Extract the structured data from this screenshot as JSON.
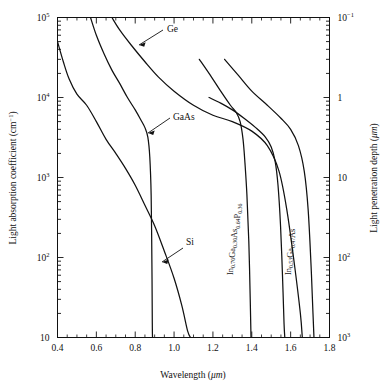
{
  "figure": {
    "background": "#ffffff",
    "line_color": "#111111"
  },
  "axes": {
    "x": {
      "title": "Wavelength (μm)",
      "title_main": "Wavelength (",
      "title_unit": "μm",
      "title_tail": ")",
      "min": 0.4,
      "max": 1.8,
      "ticks": [
        "0.4",
        "0.6",
        "0.8",
        "1.0",
        "1.2",
        "1.4",
        "1.6",
        "1.8"
      ],
      "tick_values": [
        0.4,
        0.6,
        0.8,
        1.0,
        1.2,
        1.4,
        1.6,
        1.8
      ]
    },
    "y_left": {
      "title_main": "Light absorption coefficient (cm",
      "title_sup": "−1",
      "title_tail": ")",
      "title": "Light absorption coefficient (cm⁻¹)",
      "scale": "log",
      "min": 10,
      "max": 100000,
      "ticks": [
        {
          "value": 100000,
          "mantissa": "10",
          "exponent": "5"
        },
        {
          "value": 10000,
          "mantissa": "10",
          "exponent": "4"
        },
        {
          "value": 1000,
          "mantissa": "10",
          "exponent": "3"
        },
        {
          "value": 100,
          "mantissa": "10",
          "exponent": "2"
        },
        {
          "value": 10,
          "mantissa": "10",
          "exponent": ""
        }
      ]
    },
    "y_right": {
      "title_main": "Light penetration depth (",
      "title_unit": "μm",
      "title_tail": ")",
      "title": "Light penetration depth (μm)",
      "scale": "log",
      "min": 0.1,
      "max": 1000,
      "ticks": [
        {
          "value": 0.1,
          "mantissa": "10",
          "exponent": "−1"
        },
        {
          "value": 1,
          "mantissa": "1",
          "exponent": ""
        },
        {
          "value": 10,
          "mantissa": "10",
          "exponent": ""
        },
        {
          "value": 100,
          "mantissa": "10",
          "exponent": "2"
        },
        {
          "value": 1000,
          "mantissa": "10",
          "exponent": "3"
        }
      ]
    }
  },
  "labels": {
    "ge": "Ge",
    "gaas": "GaAs",
    "si": "Si",
    "ingaasp": {
      "parts": [
        {
          "t": "In",
          "sub": false
        },
        {
          "t": "0.70",
          "sub": true
        },
        {
          "t": "Ga",
          "sub": false
        },
        {
          "t": "0.30",
          "sub": true
        },
        {
          "t": "As",
          "sub": false
        },
        {
          "t": "0.64",
          "sub": true
        },
        {
          "t": "P",
          "sub": false
        },
        {
          "t": "0.36",
          "sub": true
        }
      ],
      "plain": "In0.70Ga0.30As0.64P0.36"
    },
    "ingaas": {
      "parts": [
        {
          "t": "In",
          "sub": false
        },
        {
          "t": "0.53",
          "sub": true
        },
        {
          "t": "Ga",
          "sub": false
        },
        {
          "t": "0.47",
          "sub": true
        },
        {
          "t": "As",
          "sub": false
        }
      ],
      "plain": "In0.53Ga0.47As"
    }
  },
  "chart_data": {
    "type": "line",
    "title": "",
    "xlabel": "Wavelength (μm)",
    "ylabel": "Light absorption coefficient (cm⁻¹)",
    "ylabel_right": "Light penetration depth (μm)",
    "xlim": [
      0.4,
      1.8
    ],
    "ylim": [
      10,
      100000
    ],
    "yscale": "log",
    "grid": false,
    "legend": "inline-annotations",
    "series": [
      {
        "name": "Si",
        "label_text": "Si",
        "points": [
          [
            0.4,
            50000
          ],
          [
            0.43,
            28000
          ],
          [
            0.46,
            17000
          ],
          [
            0.5,
            11000
          ],
          [
            0.55,
            8000
          ],
          [
            0.6,
            5000
          ],
          [
            0.65,
            3000
          ],
          [
            0.7,
            2000
          ],
          [
            0.75,
            1300
          ],
          [
            0.8,
            800
          ],
          [
            0.85,
            450
          ],
          [
            0.9,
            250
          ],
          [
            0.95,
            120
          ],
          [
            1.0,
            55
          ],
          [
            1.04,
            25
          ],
          [
            1.07,
            12
          ],
          [
            1.085,
            10
          ]
        ]
      },
      {
        "name": "Ge",
        "label_text": "Ge",
        "points": [
          [
            0.68,
            100000
          ],
          [
            0.72,
            70000
          ],
          [
            0.78,
            45000
          ],
          [
            0.85,
            28000
          ],
          [
            0.92,
            18000
          ],
          [
            1.0,
            12000
          ],
          [
            1.1,
            8000
          ],
          [
            1.2,
            6000
          ],
          [
            1.3,
            5000
          ],
          [
            1.4,
            3800
          ],
          [
            1.48,
            2500
          ],
          [
            1.54,
            1200
          ],
          [
            1.58,
            400
          ],
          [
            1.62,
            80
          ],
          [
            1.65,
            20
          ],
          [
            1.66,
            10
          ]
        ]
      },
      {
        "name": "GaAs",
        "label_text": "GaAs",
        "points": [
          [
            0.57,
            100000
          ],
          [
            0.6,
            60000
          ],
          [
            0.64,
            35000
          ],
          [
            0.68,
            22000
          ],
          [
            0.72,
            15000
          ],
          [
            0.76,
            10000
          ],
          [
            0.8,
            7000
          ],
          [
            0.83,
            5200
          ],
          [
            0.85,
            4200
          ],
          [
            0.865,
            3200
          ],
          [
            0.875,
            1800
          ],
          [
            0.882,
            600
          ],
          [
            0.886,
            80
          ],
          [
            0.888,
            15
          ],
          [
            0.889,
            10
          ]
        ]
      },
      {
        "name": "In0.70Ga0.30As0.64P0.36",
        "label_text": "In0.70Ga0.30As0.64P0.36",
        "points": [
          [
            1.13,
            30000
          ],
          [
            1.18,
            20000
          ],
          [
            1.24,
            12000
          ],
          [
            1.29,
            8000
          ],
          [
            1.32,
            6500
          ],
          [
            1.34,
            5000
          ],
          [
            1.355,
            3000
          ],
          [
            1.365,
            1500
          ],
          [
            1.375,
            600
          ],
          [
            1.385,
            150
          ],
          [
            1.392,
            30
          ],
          [
            1.396,
            10
          ]
        ]
      },
      {
        "name": "In0.53Ga0.47As",
        "label_text": "In0.53Ga0.47As",
        "points": [
          [
            1.18,
            10000
          ],
          [
            1.24,
            8500
          ],
          [
            1.3,
            7000
          ],
          [
            1.36,
            5500
          ],
          [
            1.42,
            4200
          ],
          [
            1.47,
            3200
          ],
          [
            1.5,
            2400
          ],
          [
            1.52,
            1600
          ],
          [
            1.535,
            800
          ],
          [
            1.548,
            250
          ],
          [
            1.558,
            60
          ],
          [
            1.566,
            15
          ],
          [
            1.57,
            10
          ]
        ]
      },
      {
        "name": "In0.53Ga0.47As-right",
        "label_text": "",
        "points": [
          [
            1.26,
            30000
          ],
          [
            1.33,
            19000
          ],
          [
            1.4,
            12000
          ],
          [
            1.48,
            8000
          ],
          [
            1.55,
            5500
          ],
          [
            1.6,
            4000
          ],
          [
            1.64,
            2500
          ],
          [
            1.67,
            1200
          ],
          [
            1.69,
            400
          ],
          [
            1.705,
            80
          ],
          [
            1.715,
            20
          ],
          [
            1.72,
            10
          ]
        ]
      }
    ]
  }
}
